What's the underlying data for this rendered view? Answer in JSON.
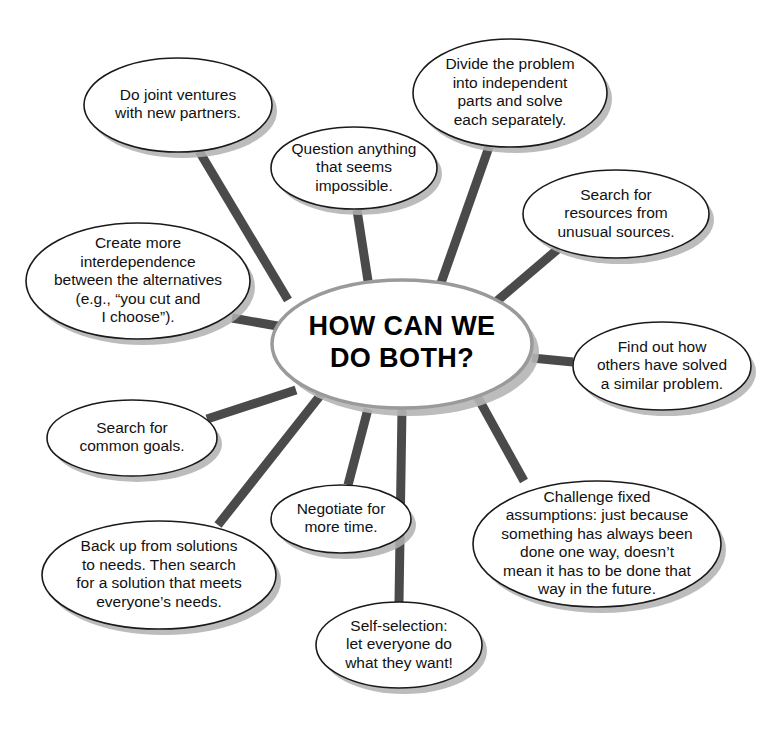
{
  "diagram": {
    "type": "mind-map",
    "background_color": "#ffffff",
    "spoke_color": "#4a4a4a",
    "node_border_color": "#1a1a1a",
    "center": {
      "label": "HOW CAN WE DO BOTH?",
      "lines": [
        "HOW CAN WE",
        "DO BOTH?"
      ],
      "cx": 402,
      "cy": 344,
      "rx": 130,
      "ry": 64
    },
    "nodes": [
      {
        "id": "joint-ventures",
        "lines": [
          "Do joint ventures",
          "with new partners."
        ],
        "cx": 178,
        "cy": 105,
        "rx": 94,
        "ry": 47
      },
      {
        "id": "question-impossible",
        "lines": [
          "Question anything",
          "that seems",
          "impossible."
        ],
        "cx": 354,
        "cy": 168,
        "rx": 83,
        "ry": 41
      },
      {
        "id": "divide-problem",
        "lines": [
          "Divide the problem",
          "into independent",
          "parts and solve",
          "each separately."
        ],
        "cx": 510,
        "cy": 93,
        "rx": 97,
        "ry": 54
      },
      {
        "id": "unusual-resources",
        "lines": [
          "Search for",
          "resources from",
          "unusual sources."
        ],
        "cx": 616,
        "cy": 214,
        "rx": 93,
        "ry": 44
      },
      {
        "id": "interdependence",
        "lines": [
          "Create more",
          "interdependence",
          "between the alternatives",
          "(e.g., “you cut and",
          "I choose”)."
        ],
        "cx": 138,
        "cy": 281,
        "rx": 112,
        "ry": 58
      },
      {
        "id": "others-solved",
        "lines": [
          "Find out how",
          "others have solved",
          "a similar problem."
        ],
        "cx": 662,
        "cy": 366,
        "rx": 89,
        "ry": 44
      },
      {
        "id": "common-goals",
        "lines": [
          "Search for",
          "common goals."
        ],
        "cx": 132,
        "cy": 438,
        "rx": 85,
        "ry": 38
      },
      {
        "id": "challenge-assumptions",
        "lines": [
          "Challenge fixed",
          "assumptions:  just because",
          "something has always been",
          "done one way, doesn’t",
          "mean it has to be done that",
          "way in the future."
        ],
        "cx": 597,
        "cy": 544,
        "rx": 124,
        "ry": 63
      },
      {
        "id": "back-up-to-needs",
        "lines": [
          "Back up from solutions",
          "to needs.  Then search",
          "for a solution that meets",
          "everyone’s needs."
        ],
        "cx": 159,
        "cy": 575,
        "rx": 117,
        "ry": 54
      },
      {
        "id": "negotiate-time",
        "lines": [
          "Negotiate for",
          "more time."
        ],
        "cx": 341,
        "cy": 519,
        "rx": 70,
        "ry": 34
      },
      {
        "id": "self-selection",
        "lines": [
          "Self-selection:",
          "let everyone do",
          "what they want!"
        ],
        "cx": 399,
        "cy": 645,
        "rx": 83,
        "ry": 43
      }
    ],
    "spokes": [
      {
        "id": "spoke-joint-ventures",
        "x1": 199,
        "y1": 151,
        "x2": 288,
        "y2": 300
      },
      {
        "id": "spoke-question-impossible",
        "x1": 357,
        "y1": 210,
        "x2": 368,
        "y2": 281
      },
      {
        "id": "spoke-divide-problem",
        "x1": 489,
        "y1": 147,
        "x2": 441,
        "y2": 283
      },
      {
        "id": "spoke-unusual-resources",
        "x1": 558,
        "y1": 249,
        "x2": 497,
        "y2": 301
      },
      {
        "id": "spoke-interdependence",
        "x1": 232,
        "y1": 318,
        "x2": 283,
        "y2": 327
      },
      {
        "id": "spoke-others-solved",
        "x1": 573,
        "y1": 362,
        "x2": 532,
        "y2": 358
      },
      {
        "id": "spoke-common-goals",
        "x1": 207,
        "y1": 419,
        "x2": 296,
        "y2": 390
      },
      {
        "id": "spoke-challenge-assumptions",
        "x1": 524,
        "y1": 481,
        "x2": 477,
        "y2": 396
      },
      {
        "id": "spoke-back-up-to-needs",
        "x1": 218,
        "y1": 525,
        "x2": 323,
        "y2": 392
      },
      {
        "id": "spoke-negotiate-time",
        "x1": 348,
        "y1": 485,
        "x2": 368,
        "y2": 409
      },
      {
        "id": "spoke-self-selection",
        "x1": 399,
        "y1": 602,
        "x2": 402,
        "y2": 409
      }
    ]
  }
}
